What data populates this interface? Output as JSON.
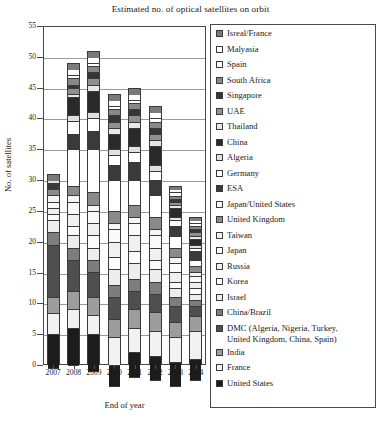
{
  "chart_data": {
    "type": "bar",
    "subtype": "stacked",
    "title": "Estimated no. of optical satellites on orbit",
    "xlabel": "End of year",
    "ylabel": "No. of satellites",
    "categories": [
      "2007",
      "2008",
      "2009",
      "2010",
      "2011",
      "2012",
      "2013",
      "2014"
    ],
    "ylim": [
      0,
      55
    ],
    "yticks": [
      0,
      5,
      10,
      15,
      20,
      25,
      30,
      35,
      40,
      45,
      50,
      55
    ],
    "grid": true,
    "legend_position": "right",
    "totals": [
      31,
      49,
      51,
      44,
      45,
      42,
      29,
      24
    ],
    "series": [
      {
        "name": "United States",
        "color": "#1c1c1c",
        "values": [
          5.5,
          6,
          6,
          3.5,
          4,
          4,
          4,
          3.5
        ]
      },
      {
        "name": "France",
        "color": "#f2f2f2",
        "values": [
          3.5,
          3,
          3,
          4.5,
          4,
          4,
          4,
          4.5
        ]
      },
      {
        "name": "India",
        "color": "#9d9d9d",
        "values": [
          2.5,
          3,
          3,
          3,
          3,
          3,
          2.5,
          2.5
        ]
      },
      {
        "name": "DMC (Algeria, Nigeria, Turkey,\nUnited Kingdom, China, Spain)",
        "color": "#4f4f4f",
        "values": [
          8.5,
          5,
          4,
          3.5,
          3,
          3,
          2.5,
          1.5
        ]
      },
      {
        "name": "China/Brazil",
        "color": "#7d7d7d",
        "values": [
          2,
          2,
          2,
          2,
          2,
          2,
          1.5,
          1
        ]
      },
      {
        "name": "Israel",
        "color": "#ededed",
        "values": [
          2,
          2,
          2,
          2.5,
          2.5,
          2,
          1.5,
          1
        ]
      },
      {
        "name": "Korea",
        "color": "#fbfbfb",
        "values": [
          1,
          1.5,
          2,
          2,
          2,
          1.5,
          1,
          1
        ]
      },
      {
        "name": "Russia",
        "color": "#f0f0f0",
        "values": [
          1,
          2,
          2,
          2.5,
          2.5,
          2,
          1.5,
          1
        ]
      },
      {
        "name": "Japan",
        "color": "#fafafa",
        "values": [
          1,
          2,
          2,
          2,
          2,
          2,
          1.5,
          1
        ]
      },
      {
        "name": "Taiwan",
        "color": "#f5f5f5",
        "values": [
          1,
          1,
          1,
          1,
          1,
          1,
          1,
          0.5
        ]
      },
      {
        "name": "United Kingdom",
        "color": "#8a8a8a",
        "values": [
          1,
          1.5,
          2,
          2,
          2,
          2,
          1.5,
          1
        ]
      },
      {
        "name": "Japan/United States",
        "color": "#ffffff",
        "values": [
          0,
          6,
          7,
          5,
          4,
          3.5,
          2,
          1
        ]
      },
      {
        "name": "ESA",
        "color": "#3a3a3a",
        "values": [
          1,
          2.5,
          3,
          2.5,
          3,
          2.5,
          1.5,
          1.5
        ]
      },
      {
        "name": "Germany",
        "color": "#ffffff",
        "values": [
          0,
          2,
          2,
          1.5,
          1.5,
          1.5,
          1,
          0.5
        ]
      },
      {
        "name": "Algeria",
        "color": "#e0e0e0",
        "values": [
          0.5,
          1,
          1,
          1,
          1,
          1,
          0.5,
          0.5
        ]
      },
      {
        "name": "China",
        "color": "#2a2a2a",
        "values": [
          0,
          3,
          3.5,
          2.5,
          3,
          3,
          1.5,
          1
        ]
      },
      {
        "name": "Thailand",
        "color": "#e8e8e8",
        "values": [
          0,
          0.5,
          1,
          1,
          1,
          1,
          0.5,
          0.5
        ]
      },
      {
        "name": "UAE",
        "color": "#909090",
        "values": [
          0,
          1,
          1,
          1,
          1,
          1,
          0.5,
          0.5
        ]
      },
      {
        "name": "Singapore",
        "color": "#353535",
        "values": [
          0,
          0.5,
          1,
          1,
          1,
          1,
          0.5,
          0.5
        ]
      },
      {
        "name": "South Africa",
        "color": "#888888",
        "values": [
          0,
          1,
          1,
          1,
          1,
          1,
          0.5,
          0.5
        ]
      },
      {
        "name": "Spain",
        "color": "#ffffff",
        "values": [
          0,
          0.5,
          0.5,
          0.5,
          0.5,
          0.5,
          0.5,
          0.5
        ]
      },
      {
        "name": "Malyasia",
        "color": "#fdfdfd",
        "values": [
          0,
          1,
          1,
          1,
          1,
          1,
          0.5,
          0.5
        ]
      },
      {
        "name": "Isreal/France",
        "color": "#7a7a7a",
        "values": [
          1,
          1,
          1,
          1,
          1,
          1,
          0.5,
          0.5
        ]
      }
    ]
  },
  "legend": {
    "items": [
      {
        "label": "Isreal/France",
        "color": "#7a7a7a"
      },
      {
        "label": "Malyasia",
        "color": "#fdfdfd"
      },
      {
        "label": "Spain",
        "color": "#ffffff"
      },
      {
        "label": "South Africa",
        "color": "#888888"
      },
      {
        "label": "Singapore",
        "color": "#353535"
      },
      {
        "label": "UAE",
        "color": "#909090"
      },
      {
        "label": "Thailand",
        "color": "#e8e8e8"
      },
      {
        "label": "China",
        "color": "#2a2a2a"
      },
      {
        "label": "Algeria",
        "color": "#e0e0e0"
      },
      {
        "label": "Germany",
        "color": "#ffffff"
      },
      {
        "label": "ESA",
        "color": "#3a3a3a"
      },
      {
        "label": "Japan/United States",
        "color": "#ffffff"
      },
      {
        "label": "United Kingdom",
        "color": "#8a8a8a"
      },
      {
        "label": "Taiwan",
        "color": "#f5f5f5"
      },
      {
        "label": "Japan",
        "color": "#fafafa"
      },
      {
        "label": "Russia",
        "color": "#f0f0f0"
      },
      {
        "label": "Korea",
        "color": "#fbfbfb"
      },
      {
        "label": "Israel",
        "color": "#ededed"
      },
      {
        "label": "China/Brazil",
        "color": "#7d7d7d"
      },
      {
        "label": "DMC (Algeria, Nigeria, Turkey,\nUnited Kingdom, China, Spain)",
        "color": "#4f4f4f"
      },
      {
        "label": "India",
        "color": "#9d9d9d"
      },
      {
        "label": "France",
        "color": "#f2f2f2"
      },
      {
        "label": "United States",
        "color": "#1c1c1c"
      }
    ]
  }
}
